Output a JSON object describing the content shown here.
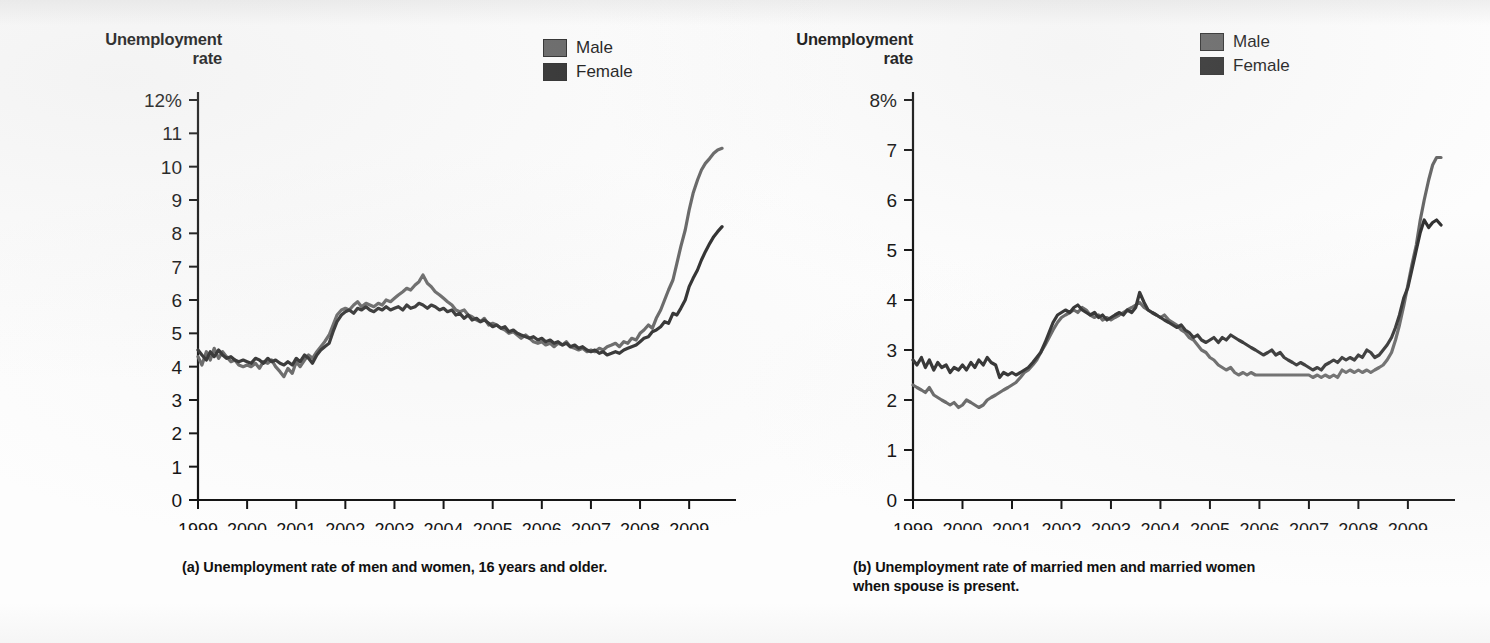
{
  "figure": {
    "background_color": "#fdfdfd",
    "ink_color": "#111111"
  },
  "panels": [
    {
      "id": "a",
      "axis_title_line1": "Unemployment",
      "axis_title_line2": "rate",
      "caption": "(a) Unemployment rate of men and women, 16 years and older.",
      "legend": {
        "items": [
          {
            "label": "Male",
            "color": "#666666"
          },
          {
            "label": "Female",
            "color": "#2f2f2f"
          }
        ]
      },
      "chart_data": {
        "type": "line",
        "title": "Unemployment rate of men and women, 16 years and older",
        "xlabel": "",
        "ylabel": "Unemployment rate",
        "xlim": [
          1999.0,
          2009.75
        ],
        "ylim": [
          0,
          12
        ],
        "yticks": [
          0,
          1,
          2,
          3,
          4,
          5,
          6,
          7,
          8,
          9,
          10,
          11,
          12
        ],
        "ytick_labels": [
          "0",
          "1",
          "2",
          "3",
          "4",
          "5",
          "6",
          "7",
          "8",
          "9",
          "10",
          "11",
          "12%"
        ],
        "xticks": [
          1999,
          2000,
          2001,
          2002,
          2003,
          2004,
          2005,
          2006,
          2007,
          2008,
          2009
        ],
        "xtick_labels": [
          "1999",
          "2000",
          "2001",
          "2002",
          "2003",
          "2004",
          "2005",
          "2006",
          "2007",
          "2008",
          "2009"
        ],
        "grid": false,
        "legend_position": "top-right",
        "x": [
          1999.0,
          1999.08,
          1999.17,
          1999.25,
          1999.33,
          1999.42,
          1999.5,
          1999.58,
          1999.67,
          1999.75,
          1999.83,
          1999.92,
          2000.0,
          2000.08,
          2000.17,
          2000.25,
          2000.33,
          2000.42,
          2000.5,
          2000.58,
          2000.67,
          2000.75,
          2000.83,
          2000.92,
          2001.0,
          2001.08,
          2001.17,
          2001.25,
          2001.33,
          2001.42,
          2001.5,
          2001.58,
          2001.67,
          2001.75,
          2001.83,
          2001.92,
          2002.0,
          2002.08,
          2002.17,
          2002.25,
          2002.33,
          2002.42,
          2002.5,
          2002.58,
          2002.67,
          2002.75,
          2002.83,
          2002.92,
          2003.0,
          2003.08,
          2003.17,
          2003.25,
          2003.33,
          2003.42,
          2003.5,
          2003.58,
          2003.67,
          2003.75,
          2003.83,
          2003.92,
          2004.0,
          2004.08,
          2004.17,
          2004.25,
          2004.33,
          2004.42,
          2004.5,
          2004.58,
          2004.67,
          2004.75,
          2004.83,
          2004.92,
          2005.0,
          2005.08,
          2005.17,
          2005.25,
          2005.33,
          2005.42,
          2005.5,
          2005.58,
          2005.67,
          2005.75,
          2005.83,
          2005.92,
          2006.0,
          2006.08,
          2006.17,
          2006.25,
          2006.33,
          2006.42,
          2006.5,
          2006.58,
          2006.67,
          2006.75,
          2006.83,
          2006.92,
          2007.0,
          2007.08,
          2007.17,
          2007.25,
          2007.33,
          2007.42,
          2007.5,
          2007.58,
          2007.67,
          2007.75,
          2007.83,
          2007.92,
          2008.0,
          2008.08,
          2008.17,
          2008.25,
          2008.33,
          2008.42,
          2008.5,
          2008.58,
          2008.67,
          2008.75,
          2008.83,
          2008.92,
          2009.0,
          2009.08,
          2009.17,
          2009.25,
          2009.33,
          2009.42,
          2009.5,
          2009.58,
          2009.67
        ],
        "series": [
          {
            "name": "Male",
            "color": "#666666",
            "values": [
              4.3,
              4.05,
              4.45,
              4.2,
              4.55,
              4.25,
              4.45,
              4.3,
              4.15,
              4.2,
              4.05,
              4.0,
              4.05,
              4.0,
              4.1,
              3.95,
              4.15,
              4.1,
              4.2,
              4.0,
              3.85,
              3.7,
              3.95,
              3.8,
              4.15,
              4.0,
              4.2,
              4.35,
              4.25,
              4.45,
              4.6,
              4.75,
              4.95,
              5.25,
              5.55,
              5.7,
              5.75,
              5.7,
              5.85,
              5.95,
              5.8,
              5.9,
              5.85,
              5.8,
              5.9,
              5.85,
              6.0,
              5.95,
              6.05,
              6.15,
              6.25,
              6.35,
              6.3,
              6.45,
              6.55,
              6.75,
              6.5,
              6.4,
              6.25,
              6.15,
              6.05,
              5.95,
              5.85,
              5.7,
              5.65,
              5.7,
              5.55,
              5.5,
              5.4,
              5.35,
              5.45,
              5.25,
              5.3,
              5.25,
              5.15,
              5.1,
              5.0,
              5.05,
              4.95,
              4.85,
              4.95,
              4.85,
              4.75,
              4.7,
              4.75,
              4.65,
              4.7,
              4.6,
              4.7,
              4.65,
              4.75,
              4.6,
              4.55,
              4.5,
              4.55,
              4.45,
              4.5,
              4.45,
              4.55,
              4.5,
              4.6,
              4.65,
              4.7,
              4.6,
              4.75,
              4.7,
              4.85,
              4.8,
              5.0,
              5.1,
              5.25,
              5.15,
              5.45,
              5.7,
              6.0,
              6.3,
              6.6,
              7.1,
              7.6,
              8.1,
              8.7,
              9.2,
              9.6,
              9.9,
              10.1,
              10.25,
              10.4,
              10.5,
              10.55
            ]
          },
          {
            "name": "Female",
            "color": "#2f2f2f",
            "values": [
              4.5,
              4.35,
              4.2,
              4.45,
              4.3,
              4.5,
              4.35,
              4.25,
              4.3,
              4.2,
              4.15,
              4.2,
              4.15,
              4.1,
              4.25,
              4.2,
              4.1,
              4.25,
              4.15,
              4.2,
              4.1,
              4.05,
              4.15,
              4.05,
              4.25,
              4.15,
              4.35,
              4.25,
              4.1,
              4.35,
              4.5,
              4.6,
              4.7,
              5.05,
              5.35,
              5.55,
              5.65,
              5.7,
              5.6,
              5.75,
              5.7,
              5.8,
              5.7,
              5.65,
              5.75,
              5.7,
              5.8,
              5.7,
              5.75,
              5.8,
              5.7,
              5.85,
              5.75,
              5.8,
              5.9,
              5.85,
              5.75,
              5.85,
              5.8,
              5.7,
              5.75,
              5.65,
              5.7,
              5.55,
              5.6,
              5.45,
              5.55,
              5.4,
              5.45,
              5.35,
              5.4,
              5.3,
              5.2,
              5.25,
              5.15,
              5.2,
              5.05,
              5.1,
              5.0,
              4.95,
              4.9,
              4.85,
              4.9,
              4.8,
              4.85,
              4.75,
              4.8,
              4.7,
              4.75,
              4.65,
              4.7,
              4.6,
              4.65,
              4.55,
              4.6,
              4.5,
              4.45,
              4.5,
              4.4,
              4.45,
              4.35,
              4.4,
              4.45,
              4.4,
              4.5,
              4.55,
              4.6,
              4.65,
              4.75,
              4.85,
              4.9,
              5.05,
              5.1,
              5.2,
              5.35,
              5.3,
              5.6,
              5.55,
              5.75,
              6.0,
              6.4,
              6.65,
              6.9,
              7.2,
              7.45,
              7.7,
              7.9,
              8.05,
              8.2
            ]
          }
        ]
      }
    },
    {
      "id": "b",
      "axis_title_line1": "Unemployment",
      "axis_title_line2": "rate",
      "caption_line1": "(b) Unemployment rate of married men and married women",
      "caption_line2": "when spouse is present.",
      "legend": {
        "items": [
          {
            "label": "Male",
            "color": "#666666"
          },
          {
            "label": "Female",
            "color": "#2f2f2f"
          }
        ]
      },
      "chart_data": {
        "type": "line",
        "title": "Unemployment rate of married men and married women when spouse is present",
        "xlabel": "",
        "ylabel": "Unemployment rate",
        "xlim": [
          1999.0,
          2009.75
        ],
        "ylim": [
          0,
          8
        ],
        "yticks": [
          0,
          1,
          2,
          3,
          4,
          5,
          6,
          7,
          8
        ],
        "ytick_labels": [
          "0",
          "1",
          "2",
          "3",
          "4",
          "5",
          "6",
          "7",
          "8%"
        ],
        "grid": false,
        "legend_position": "top-right",
        "xticks": [
          1999,
          2000,
          2001,
          2002,
          2003,
          2004,
          2005,
          2006,
          2007,
          2008,
          2009
        ],
        "xtick_labels": [
          "1999",
          "2000",
          "2001",
          "2002",
          "2003",
          "2004",
          "2005",
          "2006",
          "2007",
          "2008",
          "2009"
        ],
        "x": [
          1999.0,
          1999.08,
          1999.17,
          1999.25,
          1999.33,
          1999.42,
          1999.5,
          1999.58,
          1999.67,
          1999.75,
          1999.83,
          1999.92,
          2000.0,
          2000.08,
          2000.17,
          2000.25,
          2000.33,
          2000.42,
          2000.5,
          2000.58,
          2000.67,
          2000.75,
          2000.83,
          2000.92,
          2001.0,
          2001.08,
          2001.17,
          2001.25,
          2001.33,
          2001.42,
          2001.5,
          2001.58,
          2001.67,
          2001.75,
          2001.83,
          2001.92,
          2002.0,
          2002.08,
          2002.17,
          2002.25,
          2002.33,
          2002.42,
          2002.5,
          2002.58,
          2002.67,
          2002.75,
          2002.83,
          2002.92,
          2003.0,
          2003.08,
          2003.17,
          2003.25,
          2003.33,
          2003.42,
          2003.5,
          2003.58,
          2003.67,
          2003.75,
          2003.83,
          2003.92,
          2004.0,
          2004.08,
          2004.17,
          2004.25,
          2004.33,
          2004.42,
          2004.5,
          2004.58,
          2004.67,
          2004.75,
          2004.83,
          2004.92,
          2005.0,
          2005.08,
          2005.17,
          2005.25,
          2005.33,
          2005.42,
          2005.5,
          2005.58,
          2005.67,
          2005.75,
          2005.83,
          2005.92,
          2006.0,
          2006.08,
          2006.17,
          2006.25,
          2006.33,
          2006.42,
          2006.5,
          2006.58,
          2006.67,
          2006.75,
          2006.83,
          2006.92,
          2007.0,
          2007.08,
          2007.17,
          2007.25,
          2007.33,
          2007.42,
          2007.5,
          2007.58,
          2007.67,
          2007.75,
          2007.83,
          2007.92,
          2008.0,
          2008.08,
          2008.17,
          2008.25,
          2008.33,
          2008.42,
          2008.5,
          2008.58,
          2008.67,
          2008.75,
          2008.83,
          2008.92,
          2009.0,
          2009.08,
          2009.17,
          2009.25,
          2009.33,
          2009.42,
          2009.5,
          2009.58,
          2009.67
        ],
        "series": [
          {
            "name": "Male",
            "color": "#666666",
            "values": [
              2.3,
              2.25,
              2.2,
              2.15,
              2.25,
              2.1,
              2.05,
              2.0,
              1.95,
              1.9,
              1.95,
              1.85,
              1.9,
              2.0,
              1.95,
              1.9,
              1.85,
              1.9,
              2.0,
              2.05,
              2.1,
              2.15,
              2.2,
              2.25,
              2.3,
              2.35,
              2.45,
              2.55,
              2.6,
              2.7,
              2.8,
              2.95,
              3.1,
              3.25,
              3.4,
              3.55,
              3.65,
              3.7,
              3.75,
              3.8,
              3.75,
              3.85,
              3.8,
              3.7,
              3.65,
              3.7,
              3.6,
              3.65,
              3.6,
              3.65,
              3.7,
              3.75,
              3.8,
              3.85,
              3.9,
              3.95,
              3.85,
              3.8,
              3.75,
              3.7,
              3.65,
              3.7,
              3.6,
              3.55,
              3.5,
              3.4,
              3.35,
              3.25,
              3.2,
              3.1,
              3.0,
              2.95,
              2.85,
              2.8,
              2.7,
              2.65,
              2.6,
              2.65,
              2.55,
              2.5,
              2.55,
              2.5,
              2.55,
              2.5,
              2.5,
              2.5,
              2.5,
              2.5,
              2.5,
              2.5,
              2.5,
              2.5,
              2.5,
              2.5,
              2.5,
              2.5,
              2.5,
              2.45,
              2.5,
              2.45,
              2.5,
              2.45,
              2.5,
              2.45,
              2.6,
              2.55,
              2.6,
              2.55,
              2.6,
              2.55,
              2.6,
              2.55,
              2.6,
              2.65,
              2.7,
              2.8,
              2.95,
              3.2,
              3.5,
              3.9,
              4.3,
              4.7,
              5.1,
              5.6,
              6.0,
              6.4,
              6.7,
              6.85,
              6.85
            ]
          },
          {
            "name": "Female",
            "color": "#2f2f2f",
            "values": [
              2.8,
              2.7,
              2.85,
              2.65,
              2.8,
              2.6,
              2.75,
              2.65,
              2.7,
              2.55,
              2.65,
              2.6,
              2.7,
              2.6,
              2.75,
              2.65,
              2.8,
              2.7,
              2.85,
              2.75,
              2.7,
              2.45,
              2.55,
              2.5,
              2.55,
              2.5,
              2.55,
              2.6,
              2.65,
              2.75,
              2.85,
              2.95,
              3.15,
              3.35,
              3.55,
              3.7,
              3.75,
              3.8,
              3.75,
              3.85,
              3.9,
              3.8,
              3.75,
              3.7,
              3.75,
              3.65,
              3.7,
              3.6,
              3.65,
              3.7,
              3.75,
              3.7,
              3.8,
              3.75,
              3.85,
              4.15,
              3.95,
              3.8,
              3.75,
              3.7,
              3.65,
              3.6,
              3.55,
              3.5,
              3.45,
              3.5,
              3.4,
              3.35,
              3.25,
              3.3,
              3.2,
              3.15,
              3.2,
              3.25,
              3.15,
              3.25,
              3.2,
              3.3,
              3.25,
              3.2,
              3.15,
              3.1,
              3.05,
              3.0,
              2.95,
              2.9,
              2.95,
              3.0,
              2.9,
              2.95,
              2.85,
              2.8,
              2.75,
              2.7,
              2.75,
              2.7,
              2.65,
              2.6,
              2.65,
              2.6,
              2.7,
              2.75,
              2.8,
              2.75,
              2.85,
              2.8,
              2.85,
              2.8,
              2.9,
              2.85,
              3.0,
              2.95,
              2.85,
              2.9,
              3.0,
              3.1,
              3.25,
              3.45,
              3.7,
              4.05,
              4.25,
              4.6,
              5.0,
              5.35,
              5.6,
              5.45,
              5.55,
              5.6,
              5.5
            ]
          }
        ]
      }
    }
  ]
}
